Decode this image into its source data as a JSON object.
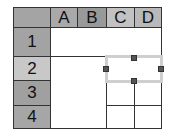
{
  "spreadsheet": {
    "corner_color": "#a4a4a4",
    "columns": [
      {
        "label": "A",
        "color": "#a9a9a9"
      },
      {
        "label": "B",
        "color": "#999999"
      },
      {
        "label": "C",
        "color": "#c2c2c2"
      },
      {
        "label": "D",
        "color": "#b9b9b9"
      }
    ],
    "rows": [
      {
        "label": "1",
        "color": "#a3a3a3"
      },
      {
        "label": "2",
        "color": "#c8c8c8"
      },
      {
        "label": "3",
        "color": "#a0a0a0"
      },
      {
        "label": "4",
        "color": "#a6a6a6"
      }
    ],
    "selection": {
      "range": "C2:D2",
      "border_color": "#cfcfcf",
      "handle_color": "#555555"
    }
  }
}
